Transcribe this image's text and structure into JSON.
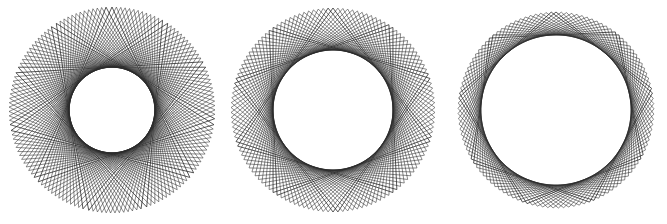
{
  "canvas": {
    "width": 667,
    "height": 224,
    "background": "#ffffff",
    "title": "Three nested star-polygon spirograph figures"
  },
  "style": {
    "stroke": "#2b2b2b",
    "stroke_width": 0.55,
    "stroke_width_outline": 0.8,
    "fill": "none",
    "line_join": "miter"
  },
  "figures": [
    {
      "name": "figure-left-11-point-star",
      "label": "Left star figure",
      "center_x": 112,
      "center_y": 110,
      "radius": 103,
      "points": 11,
      "step": 4,
      "repeats": 13,
      "rotation_increment_deg": 2.45,
      "base_rotation_deg": -90,
      "point_sharpness": "sharp",
      "description": "11/4 star polygon repeated 13 times with small rotation offsets producing crosshatched tips"
    },
    {
      "name": "figure-middle-10-point-star",
      "label": "Middle star figure",
      "center_x": 333,
      "center_y": 110,
      "radius": 102,
      "points": 10,
      "step": 3,
      "repeats": 13,
      "rotation_increment_deg": 2.77,
      "base_rotation_deg": -90,
      "point_sharpness": "medium",
      "description": "10/3 star polygon repeated 13 times with small rotation offsets"
    },
    {
      "name": "figure-right-9-point-star",
      "label": "Right star figure",
      "center_x": 556,
      "center_y": 110,
      "radius": 98,
      "points": 9,
      "step": 2,
      "repeats": 13,
      "rotation_increment_deg": 3.1,
      "base_rotation_deg": -90,
      "point_sharpness": "shallow",
      "description": "9/2 star polygon repeated 13 times with small rotation offsets, nearly circular"
    }
  ]
}
